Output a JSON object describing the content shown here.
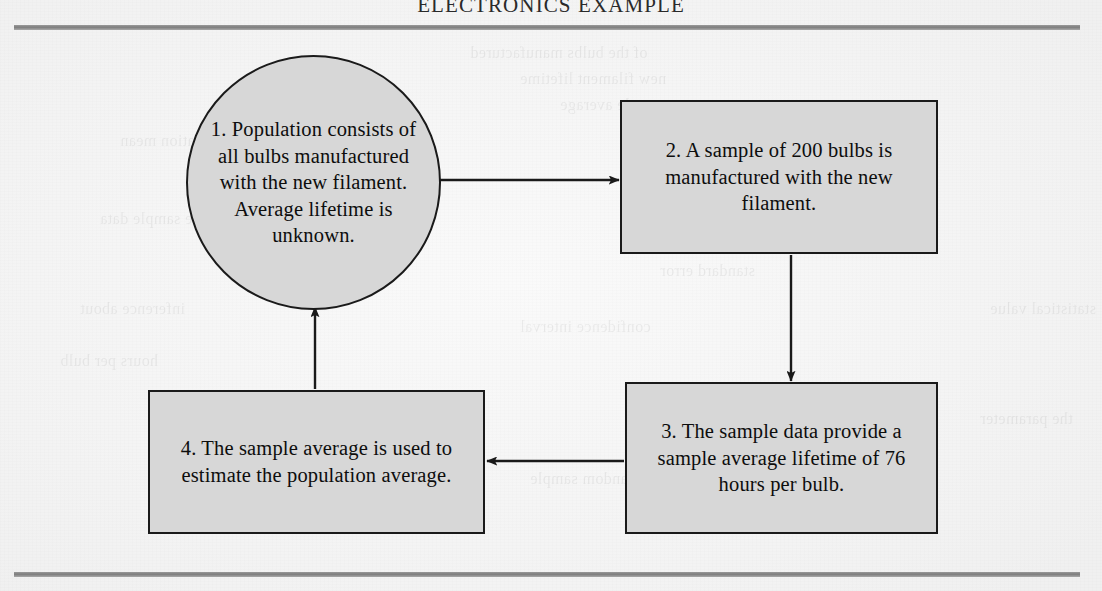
{
  "page": {
    "running_head": "ELECTRONICS EXAMPLE",
    "paper_color": "#f4f4f4",
    "rule_color": "#7d7d7d"
  },
  "diagram": {
    "type": "cycle-flowchart",
    "node_fill": "#d7d7d7",
    "node_stroke": "#1a1a1a",
    "nodes": [
      {
        "id": "node-1",
        "shape": "circle",
        "number": "1.",
        "text": "1.  Population consists of all bulbs manufactured with the new filament. Average lifetime is unknown."
      },
      {
        "id": "node-2",
        "shape": "rectangle",
        "number": "2.",
        "text": "2.  A sample of 200 bulbs is manufactured with the new filament."
      },
      {
        "id": "node-3",
        "shape": "rectangle",
        "number": "3.",
        "text": "3.  The sample data provide a sample average lifetime of 76 hours per bulb."
      },
      {
        "id": "node-4",
        "shape": "rectangle",
        "number": "4.",
        "text": "4.  The sample average is used to estimate the population average."
      }
    ],
    "edges": [
      {
        "id": "edge-1-2",
        "from": "node-1",
        "to": "node-2",
        "direction": "right"
      },
      {
        "id": "edge-2-3",
        "from": "node-2",
        "to": "node-3",
        "direction": "down"
      },
      {
        "id": "edge-3-4",
        "from": "node-3",
        "to": "node-4",
        "direction": "left"
      },
      {
        "id": "edge-4-1",
        "from": "node-4",
        "to": "node-1",
        "direction": "up"
      }
    ]
  },
  "ghosts": [
    {
      "text": "of the bulbs manufactured",
      "x": 470,
      "y": 44
    },
    {
      "text": "new filament lifetime",
      "x": 520,
      "y": 70
    },
    {
      "text": "sample average",
      "x": 560,
      "y": 96
    },
    {
      "text": "population mean",
      "x": 120,
      "y": 132
    },
    {
      "text": "estimate of the",
      "x": 640,
      "y": 152
    },
    {
      "text": "the sample data",
      "x": 100,
      "y": 210
    },
    {
      "text": "standard error",
      "x": 660,
      "y": 262
    },
    {
      "text": "inference about",
      "x": 80,
      "y": 300
    },
    {
      "text": "confidence interval",
      "x": 520,
      "y": 318
    },
    {
      "text": "hours per bulb",
      "x": 60,
      "y": 352
    },
    {
      "text": "the parameter",
      "x": 980,
      "y": 410
    },
    {
      "text": "random sample",
      "x": 530,
      "y": 470
    },
    {
      "text": "statistical value",
      "x": 990,
      "y": 300
    }
  ]
}
